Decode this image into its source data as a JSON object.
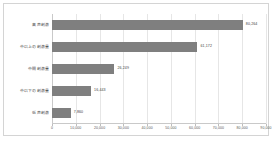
{
  "chart_data": {
    "type": "bar",
    "orientation": "horizontal",
    "title": "",
    "xlabel": "",
    "ylabel": "",
    "categories": [
      "高声刺激",
      "中以上の刺激量",
      "中間刺激量",
      "中以下の刺激量",
      "低声刺激"
    ],
    "values": [
      80264,
      61172,
      26249,
      16443,
      7860
    ],
    "value_labels": [
      "80,264",
      "61,172",
      "26,249",
      "16,443",
      "7,860"
    ],
    "xlim": [
      0,
      90000
    ],
    "xticks": [
      0,
      10000,
      20000,
      30000,
      40000,
      50000,
      60000,
      70000,
      80000,
      90000
    ],
    "xtick_labels": [
      "0",
      "10,000",
      "20,000",
      "30,000",
      "40,000",
      "50,000",
      "60,000",
      "70,000",
      "80,000",
      "90,000"
    ],
    "grid": true,
    "grid_axis": "x",
    "legend": false,
    "bar_color": "#7f7f7f",
    "grid_color": "#e6e6e6",
    "axis_color": "#c9c9c9",
    "plot_background": "#ffffff",
    "frame_border_color": "#d4d4d4"
  }
}
